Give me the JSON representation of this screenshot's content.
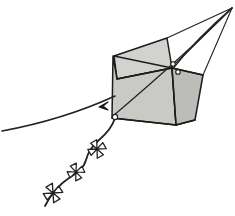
{
  "artwork": {
    "title": "Box kite with tail",
    "subject": "kite",
    "style": "pen-and-ink line drawing",
    "background_color": "#ffffff",
    "canvas": {
      "width": 235,
      "height": 216
    }
  },
  "palette": {
    "ink": "#1c1c1c",
    "line": "#232323",
    "panel_fill_light": "#d2d2cf",
    "panel_fill_mid": "#c9c9c6",
    "panel_fill_dark": "#bcbcb8",
    "paper": "#ffffff"
  },
  "geometry": {
    "apex": {
      "x": 232,
      "y": 8,
      "label": "bridle convergence point"
    },
    "panels": [
      {
        "name": "top-face",
        "fill": "#d2d2cf",
        "stroke_width": 1.5,
        "points": "114,56 167,38 172,68 117,79"
      },
      {
        "name": "left-face",
        "fill": "#c9c9c6",
        "stroke_width": 1.5,
        "points": "113,56 117,79 172,68 176,125 112,118"
      },
      {
        "name": "right-face",
        "fill": "#bcbcb8",
        "stroke_width": 1.5,
        "points": "172,68 203,75 195,120 176,125"
      }
    ],
    "spars": [
      {
        "name": "top-face-diagonal",
        "d": "M 114,56 L 172,68",
        "stroke_width": 1.4
      },
      {
        "name": "upper-cross-left",
        "d": "M 117,79 L 172,68",
        "stroke_width": 1.4
      },
      {
        "name": "right-face-upper-edge",
        "d": "M 172,68 L 203,75",
        "stroke_width": 1.4
      },
      {
        "name": "right-face-lower-edge",
        "d": "M 176,125 L 195,120",
        "stroke_width": 1.4
      },
      {
        "name": "keel-edge",
        "d": "M 172,68 L 176,125",
        "stroke_width": 1.4
      },
      {
        "name": "bottom-edge",
        "d": "M 112,118 L 176,125",
        "stroke_width": 1.6
      }
    ],
    "bridle_lines": [
      {
        "name": "bridle-to-top-corner",
        "d": "M 232,8 L 167,38",
        "stroke_width": 1.2
      },
      {
        "name": "bridle-to-knot-upper",
        "d": "M 232,8 L 173,66",
        "stroke_width": 1.2
      },
      {
        "name": "bridle-to-knot-lower",
        "d": "M 232,8 C 206,30 186,52 172,70",
        "stroke_width": 1.2
      },
      {
        "name": "bridle-to-right-tip",
        "d": "M 232,8 L 203,75",
        "stroke_width": 1.1
      },
      {
        "name": "bridle-sweep-to-lower-left",
        "d": "M 232,8 C 200,40 160,76 113,116",
        "stroke_width": 1.2
      }
    ],
    "knots": [
      {
        "name": "knot-mid-right",
        "cx": 173,
        "cy": 64,
        "r": 2.3
      },
      {
        "name": "knot-mid-right-lower",
        "cx": 178,
        "cy": 72,
        "r": 2.3
      },
      {
        "name": "knot-bottom-left",
        "cx": 115,
        "cy": 117,
        "r": 2.6
      }
    ],
    "flying_line": {
      "name": "kite-string",
      "d": "M 2,131 C 40,124 80,112 115,96",
      "stroke_width": 1.6
    },
    "barb": {
      "name": "line-marker",
      "points": "99,107 108,102 103,106 108,110",
      "stroke_width": 1.2
    },
    "tail": {
      "name": "kite-tail",
      "d": "M 115,118 C 112,128 106,134 99,140 C 91,147 88,152 86,160 C 84,168 77,173 69,178 C 60,184 52,192 45,206",
      "stroke_width": 1.8
    },
    "bows": [
      {
        "name": "tail-bow-1",
        "cx": 97,
        "cy": 149,
        "rotation": -38,
        "scale": 1.0,
        "stroke_width": 1.3
      },
      {
        "name": "tail-bow-2",
        "cx": 76,
        "cy": 172,
        "rotation": -34,
        "scale": 0.95,
        "stroke_width": 1.3
      },
      {
        "name": "tail-bow-3",
        "cx": 53,
        "cy": 193,
        "rotation": -40,
        "scale": 1.05,
        "stroke_width": 1.3
      }
    ]
  }
}
